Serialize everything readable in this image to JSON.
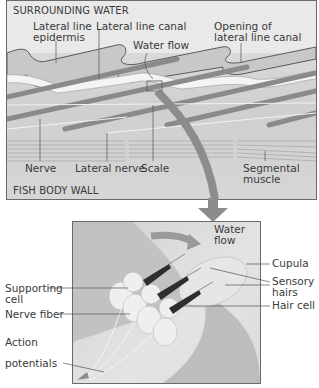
{
  "top_panel": {
    "region_top": "SURROUNDING WATER",
    "region_bottom": "FISH BODY WALL",
    "labels": {
      "lateral_line_epidermis_1": "Lateral line",
      "lateral_line_epidermis_2": "epidermis",
      "lateral_line_canal": "Lateral line canal",
      "water_flow": "Water flow",
      "opening_1": "Opening of",
      "opening_2": "lateral line canal",
      "nerve": "Nerve",
      "lateral_nerve": "Lateral nerve",
      "scale": "Scale",
      "segmental_muscle_1": "Segmental",
      "segmental_muscle_2": "muscle"
    }
  },
  "bottom_panel": {
    "labels": {
      "water_flow_1": "Water",
      "water_flow_2": "flow",
      "cupula": "Cupula",
      "supporting_cell_1": "Supporting",
      "supporting_cell_2": "cell",
      "sensory_hairs_1": "Sensory",
      "sensory_hairs_2": "hairs",
      "nerve_fiber": "Nerve fiber",
      "hair_cell": "Hair cell",
      "action_potentials_1": "Action",
      "action_potentials_2": "potentials"
    }
  },
  "colors": {
    "label_text": "#3a3a3a",
    "leader_line": "#555555",
    "scale_rod": "#8a8a8a",
    "arrow": "#8c8c8c",
    "hair_bundle": "#2e2e2e"
  }
}
